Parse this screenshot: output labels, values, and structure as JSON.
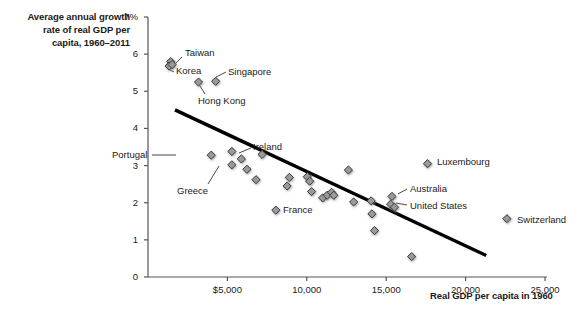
{
  "chart_data": {
    "type": "scatter",
    "title": "",
    "ylabel": "Average annual growth rate of real GDP per capita, 1960–2011",
    "ylabel_lines": [
      "Average annual growth",
      "rate of real GDP per",
      "capita, 1960–2011"
    ],
    "xlabel": "Real GDP per capita in 1960",
    "xlim": [
      0,
      25000
    ],
    "ylim": [
      0,
      7
    ],
    "grid": false,
    "legend": "none",
    "y_unit_suffix": "%",
    "yticks": [
      0,
      1,
      2,
      3,
      4,
      5,
      6,
      7
    ],
    "ytick_labels": [
      "0",
      "1",
      "2",
      "3",
      "4",
      "5",
      "6",
      "7%"
    ],
    "xticks": [
      5000,
      10000,
      15000,
      20000,
      25000
    ],
    "xtick_labels": [
      "$5,000",
      "10,000",
      "15,000",
      "20,000",
      "25,000"
    ],
    "points": [
      {
        "name": "Taiwan",
        "x": 1430,
        "y": 5.8,
        "labeled": true
      },
      {
        "name": "Korea",
        "x": 1330,
        "y": 5.68,
        "labeled": true
      },
      {
        "name": "",
        "x": 1520,
        "y": 5.72,
        "labeled": false
      },
      {
        "name": "Hong Kong",
        "x": 3180,
        "y": 5.25,
        "labeled": true
      },
      {
        "name": "Singapore",
        "x": 4260,
        "y": 5.27,
        "labeled": true
      },
      {
        "name": "Portugal",
        "x": 3980,
        "y": 3.28,
        "labeled": true
      },
      {
        "name": "",
        "x": 5280,
        "y": 3.38,
        "labeled": false
      },
      {
        "name": "Greece",
        "x": 5280,
        "y": 3.02,
        "labeled": true
      },
      {
        "name": "",
        "x": 5880,
        "y": 3.18,
        "labeled": false
      },
      {
        "name": "",
        "x": 6230,
        "y": 2.9,
        "labeled": false
      },
      {
        "name": "",
        "x": 6800,
        "y": 2.62,
        "labeled": false
      },
      {
        "name": "Ireland",
        "x": 7180,
        "y": 3.3,
        "labeled": true
      },
      {
        "name": "France",
        "x": 8050,
        "y": 1.8,
        "labeled": true
      },
      {
        "name": "",
        "x": 8760,
        "y": 2.45,
        "labeled": false
      },
      {
        "name": "",
        "x": 8900,
        "y": 2.68,
        "labeled": false
      },
      {
        "name": "",
        "x": 10030,
        "y": 2.7,
        "labeled": false
      },
      {
        "name": "",
        "x": 10180,
        "y": 2.58,
        "labeled": false
      },
      {
        "name": "",
        "x": 10300,
        "y": 2.3,
        "labeled": false
      },
      {
        "name": "",
        "x": 11000,
        "y": 2.13,
        "labeled": false
      },
      {
        "name": "",
        "x": 11280,
        "y": 2.2,
        "labeled": false
      },
      {
        "name": "",
        "x": 11560,
        "y": 2.28,
        "labeled": false
      },
      {
        "name": "",
        "x": 11700,
        "y": 2.2,
        "labeled": false
      },
      {
        "name": "",
        "x": 12620,
        "y": 2.88,
        "labeled": false
      },
      {
        "name": "",
        "x": 12950,
        "y": 2.02,
        "labeled": false
      },
      {
        "name": "",
        "x": 14050,
        "y": 2.05,
        "labeled": false
      },
      {
        "name": "",
        "x": 14100,
        "y": 1.7,
        "labeled": false
      },
      {
        "name": "",
        "x": 14260,
        "y": 1.25,
        "labeled": false
      },
      {
        "name": "Australia",
        "x": 15360,
        "y": 2.17,
        "labeled": true
      },
      {
        "name": "United States",
        "x": 15280,
        "y": 1.96,
        "labeled": true
      },
      {
        "name": "",
        "x": 15520,
        "y": 1.88,
        "labeled": false
      },
      {
        "name": "",
        "x": 16600,
        "y": 0.55,
        "labeled": false
      },
      {
        "name": "Luxembourg",
        "x": 17600,
        "y": 3.05,
        "labeled": true
      },
      {
        "name": "Switzerland",
        "x": 22600,
        "y": 1.57,
        "labeled": true
      }
    ],
    "trendline": {
      "x1": 1700,
      "y1": 4.5,
      "x2": 21300,
      "y2": 0.58
    },
    "annotations": [
      {
        "label": "Taiwan",
        "text_x": 185,
        "text_y": 48,
        "leader": [
          [
            182,
            57
          ],
          [
            176,
            63
          ]
        ]
      },
      {
        "label": "Korea",
        "text_x": 176,
        "text_y": 66,
        "leader": [
          [
            174,
            72
          ],
          [
            170,
            70
          ]
        ]
      },
      {
        "label": "Singapore",
        "text_x": 228,
        "text_y": 67,
        "leader": [
          [
            226,
            72
          ],
          [
            216,
            77
          ]
        ]
      },
      {
        "label": "Hong Kong",
        "text_x": 198,
        "text_y": 96,
        "leader": [
          [
            205,
            94
          ],
          [
            200,
            86
          ]
        ]
      },
      {
        "label": "Portugal",
        "text_x": 112,
        "text_y": 150,
        "leader": [
          [
            152,
            155
          ],
          [
            176,
            155
          ]
        ]
      },
      {
        "label": "Ireland",
        "text_x": 253,
        "text_y": 142,
        "leader": [
          [
            251,
            148
          ],
          [
            239,
            153
          ]
        ]
      },
      {
        "label": "Greece",
        "text_x": 177,
        "text_y": 186,
        "leader": [
          [
            208,
            184
          ],
          [
            219,
            166
          ]
        ]
      },
      {
        "label": "France",
        "text_x": 283,
        "text_y": 205,
        "leader": null
      },
      {
        "label": "Australia",
        "text_x": 410,
        "text_y": 184,
        "leader": [
          [
            407,
            189
          ],
          [
            398,
            194
          ]
        ]
      },
      {
        "label": "United States",
        "text_x": 410,
        "text_y": 201,
        "leader": [
          [
            407,
            205
          ],
          [
            396,
            203
          ]
        ]
      },
      {
        "label": "Luxembourg",
        "text_x": 437,
        "text_y": 157,
        "leader": null
      },
      {
        "label": "Switzerland",
        "text_x": 517,
        "text_y": 215,
        "leader": null
      }
    ]
  },
  "axes": {
    "y_title_lines": [
      "Average annual growth",
      "rate of real GDP per",
      "capita, 1960–2011"
    ],
    "x_title": "Real GDP per capita in 1960"
  },
  "style": {
    "marker_fill": "#9a9a9a",
    "marker_stroke": "#2b2b2b",
    "trendline_color": "#000000",
    "axis_color": "#555555",
    "text_color": "#1a1a1a",
    "background": "#ffffff"
  }
}
